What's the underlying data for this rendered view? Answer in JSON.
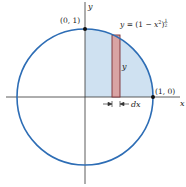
{
  "diagram": {
    "type": "unit-circle-area-integral",
    "colors": {
      "circle": "#2d6db5",
      "shaded_region": "#cfe1f1",
      "strip_fill": "#d9a3a3",
      "strip_stroke": "#7a2e33",
      "axis": "#333333",
      "point": "#111111"
    },
    "axes": {
      "x_label": "x",
      "y_label": "y"
    },
    "points": [
      {
        "label": "(0, 1)",
        "x": 0,
        "y": 1
      },
      {
        "label": "(1, 0)",
        "x": 1,
        "y": 0
      }
    ],
    "curve_label": {
      "prefix": "y = (1 − x",
      "power": "2",
      "suffix": ")",
      "exponent_num": "1",
      "exponent_den": "2"
    },
    "strip": {
      "height_label": "y",
      "width_label": "dx"
    }
  }
}
